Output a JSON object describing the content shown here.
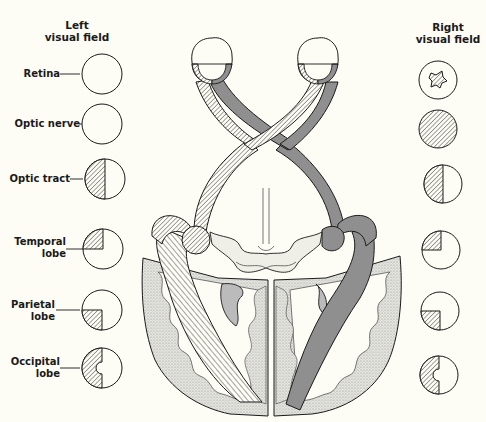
{
  "figure": {
    "type": "Visual pathway diagram — visual field defects from lesions at different levels",
    "colors": {
      "background": "#fdfcf5",
      "line": "#1a1a1a",
      "left_field_pathway_fill": "hatched",
      "right_field_pathway_fill": "#8f8f8f",
      "cortex_stipple": "#cfcfcf"
    }
  },
  "headers": {
    "left": [
      "Left",
      "visual field"
    ],
    "right": [
      "Right",
      "visual field"
    ]
  },
  "rows": [
    {
      "label": [
        "Retina"
      ],
      "left_defect": "none",
      "right_defect": "central scotoma (irregular star-shaped)"
    },
    {
      "label": [
        "Optic nerve"
      ],
      "left_defect": "none",
      "right_defect": "complete blindness"
    },
    {
      "label": [
        "Optic tract"
      ],
      "left_defect": "left homonymous hemianopia",
      "right_defect": "left homonymous hemianopia"
    },
    {
      "label": [
        "Temporal",
        "lobe"
      ],
      "left_defect": "upper left quadrantanopia",
      "right_defect": "upper left quadrantanopia"
    },
    {
      "label": [
        "Parietal",
        "lobe"
      ],
      "left_defect": "lower left quadrantanopia",
      "right_defect": "lower left quadrantanopia"
    },
    {
      "label": [
        "Occipital",
        "lobe"
      ],
      "left_defect": "left hemianopia with macular sparing",
      "right_defect": "left hemianopia with macular sparing"
    }
  ],
  "anatomy": {
    "structures": [
      "left eye",
      "right eye",
      "optic nerves",
      "optic chiasm",
      "optic tracts",
      "lateral geniculate bodies",
      "optic radiations",
      "midbrain",
      "occipital cortex"
    ]
  }
}
